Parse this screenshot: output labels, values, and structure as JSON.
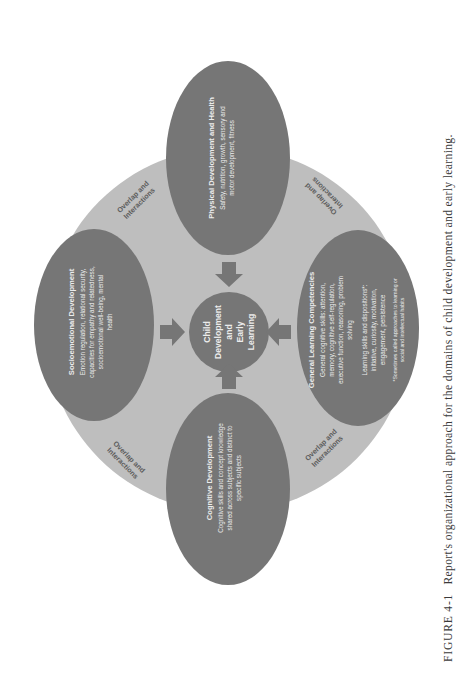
{
  "figure": {
    "colors": {
      "background": "#ffffff",
      "outer_circle": "#bebebe",
      "domain_ellipse": "#767676",
      "center_circle": "#767676",
      "arrow": "#767676",
      "ellipse_text": "#ececec",
      "overlap_text": "#5c5c5c"
    },
    "center": {
      "lines": [
        "Child",
        "Development",
        "and",
        "Early",
        "Learning"
      ]
    },
    "domains": [
      {
        "id": "physical",
        "title": "Physical Development and Health",
        "body_lines": [
          "Safety, nutrition, growth, sensory and",
          "motor development, fitness"
        ]
      },
      {
        "id": "socioemotional",
        "title": "Socioemotional Development",
        "body_lines": [
          "Emotion regulation, relational security,",
          "capacities for empathy and relatedness,",
          "socioemotional well-being, mental",
          "health"
        ]
      },
      {
        "id": "cognitive",
        "title": "Cognitive Development",
        "body_lines": [
          "Cognitive skills and concept knowledge",
          "shared across subjects and distinct to",
          "specific subjects"
        ]
      },
      {
        "id": "general-learning",
        "title": "General Learning Competencies",
        "body_lines": [
          "General cognitive skills: attention,",
          "memory, cognitive self-regulation,",
          "executive function, reasoning, problem",
          "solving"
        ],
        "body2_lines": [
          "Learning skills and dispositions*:",
          "initiative, curiosity, motivation,",
          "engagement, persistence"
        ],
        "footnote_lines": [
          "*Sometimes called approaches to learning or",
          "social and intellectual habits"
        ]
      }
    ],
    "overlap_labels": [
      {
        "position": "upper-left",
        "lines": [
          "Overlap and",
          "Interactions"
        ]
      },
      {
        "position": "upper-right",
        "lines": [
          "Overlap and",
          "Interactions"
        ]
      },
      {
        "position": "lower-left",
        "lines": [
          "Overlap and",
          "Interactions"
        ]
      },
      {
        "position": "lower-right",
        "lines": [
          "Overlap and",
          "Interactions"
        ]
      }
    ],
    "caption": {
      "label": "FIGURE 4-1",
      "text": "Report's organizational approach for the domains of child development and early learning."
    }
  }
}
